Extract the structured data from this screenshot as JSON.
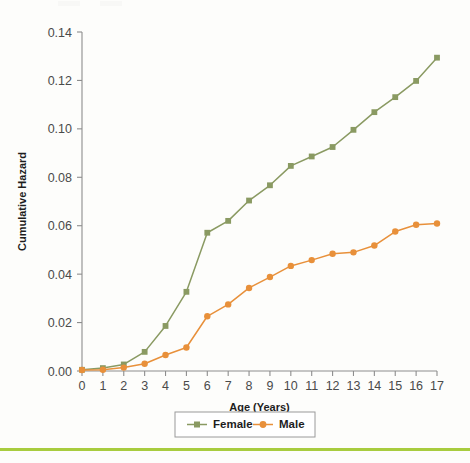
{
  "chart_data": {
    "type": "line",
    "title": "",
    "xlabel": "Age (Years)",
    "ylabel": "Cumulative Hazard",
    "xlim": [
      0,
      17
    ],
    "ylim": [
      0.0,
      0.14
    ],
    "grid": false,
    "legend_position": "bottom-center",
    "x": [
      0,
      1,
      2,
      3,
      4,
      5,
      6,
      7,
      8,
      9,
      10,
      11,
      12,
      13,
      14,
      15,
      16,
      17
    ],
    "xtick_labels": [
      "0",
      "1",
      "2",
      "3",
      "4",
      "5",
      "6",
      "7",
      "8",
      "9",
      "10",
      "11",
      "12",
      "13",
      "14",
      "15",
      "16",
      "17"
    ],
    "ytick_values": [
      0.0,
      0.02,
      0.04,
      0.06,
      0.08,
      0.1,
      0.12,
      0.14
    ],
    "ytick_labels": [
      "0.00",
      "0.02",
      "0.04",
      "0.06",
      "0.08",
      "0.10",
      "0.12",
      "0.14"
    ],
    "series": [
      {
        "name": "Female",
        "color": "#8a9a62",
        "marker": "square",
        "values": [
          0.0005,
          0.0012,
          0.0027,
          0.0079,
          0.0186,
          0.0327,
          0.0571,
          0.062,
          0.0704,
          0.0767,
          0.0847,
          0.0886,
          0.0925,
          0.0996,
          0.1069,
          0.1131,
          0.1198,
          0.1294
        ]
      },
      {
        "name": "Male",
        "color": "#e8903a",
        "marker": "circle",
        "values": [
          0.0004,
          0.0005,
          0.0014,
          0.003,
          0.0066,
          0.0097,
          0.0226,
          0.0275,
          0.0343,
          0.0388,
          0.0434,
          0.0458,
          0.0484,
          0.049,
          0.0518,
          0.0576,
          0.0604,
          0.0609
        ]
      }
    ]
  },
  "legend": {
    "entries": [
      {
        "label": "Female",
        "color": "#8a9a62",
        "marker": "square"
      },
      {
        "label": "Male",
        "color": "#e8903a",
        "marker": "circle"
      }
    ]
  },
  "footer": {
    "rule_color": "#a8cc3e"
  }
}
